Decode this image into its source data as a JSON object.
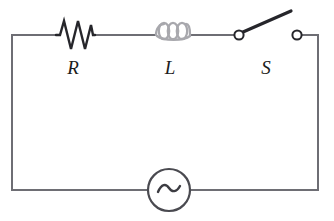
{
  "figure": {
    "kind": "ac-series-rls-circuit-diagram",
    "width": 334,
    "height": 221,
    "background_color": "#ffffff"
  },
  "labels": {
    "resistor": "R",
    "inductor": "L",
    "switch": "S"
  },
  "components": [
    {
      "id": "resistor",
      "icon": "resistor-zigzag-icon",
      "label": "R",
      "color": "#26262b",
      "position": {
        "x": 75,
        "y": 35
      }
    },
    {
      "id": "inductor",
      "icon": "inductor-coil-icon",
      "label": "L",
      "color": "#a8a8ad",
      "position": {
        "x": 172,
        "y": 35
      }
    },
    {
      "id": "switch",
      "icon": "switch-open-icon",
      "label": "S",
      "color": "#26262b",
      "state": "open",
      "position": {
        "x": 267,
        "y": 30
      }
    },
    {
      "id": "ac-source",
      "icon": "ac-source-sine-icon",
      "label": "",
      "color": "#4a4a50",
      "position": {
        "x": 169,
        "y": 190
      }
    }
  ],
  "wire": {
    "color": "#6e6e74",
    "width": 2
  }
}
